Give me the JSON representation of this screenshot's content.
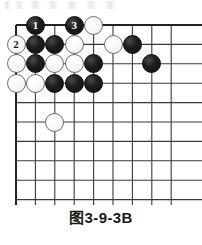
{
  "figure": {
    "caption": "图3-9-3B",
    "type": "go-board-diagram"
  },
  "board": {
    "columns": 9,
    "rows": 10,
    "origin_x": 16,
    "origin_y": 25,
    "spacing": 19.4,
    "line_color": "#3a3a3a",
    "edge_line_color": "#222222",
    "background": "#ffffff",
    "stone_radius": 9.5
  },
  "colors": {
    "black_stone": "#1d1d1d",
    "white_stone": "#f7f7f7",
    "white_stone_outline": "#707070",
    "caption_text": "#1a1a1a"
  },
  "stones": [
    {
      "id": "s0",
      "color": "black",
      "col": 1,
      "row": 0,
      "label": "1"
    },
    {
      "id": "s1",
      "color": "black",
      "col": 3,
      "row": 0,
      "label": "3"
    },
    {
      "id": "s2",
      "color": "white",
      "col": 4,
      "row": 0,
      "label": ""
    },
    {
      "id": "s3",
      "color": "white",
      "col": 0,
      "row": 1,
      "label": "2"
    },
    {
      "id": "s4",
      "color": "black",
      "col": 1,
      "row": 1,
      "label": ""
    },
    {
      "id": "s5",
      "color": "black",
      "col": 2,
      "row": 1,
      "label": ""
    },
    {
      "id": "s6",
      "color": "white",
      "col": 3,
      "row": 1,
      "label": ""
    },
    {
      "id": "s7",
      "color": "white",
      "col": 5,
      "row": 1,
      "label": ""
    },
    {
      "id": "s8",
      "color": "black",
      "col": 6,
      "row": 1,
      "label": ""
    },
    {
      "id": "s9",
      "color": "white",
      "col": 0,
      "row": 2,
      "label": ""
    },
    {
      "id": "s10",
      "color": "black",
      "col": 1,
      "row": 2,
      "label": ""
    },
    {
      "id": "s11",
      "color": "white",
      "col": 2,
      "row": 2,
      "label": ""
    },
    {
      "id": "s12",
      "color": "white",
      "col": 3,
      "row": 2,
      "label": ""
    },
    {
      "id": "s13",
      "color": "black",
      "col": 4,
      "row": 2,
      "label": ""
    },
    {
      "id": "s14",
      "color": "black",
      "col": 7,
      "row": 2,
      "label": ""
    },
    {
      "id": "s15",
      "color": "white",
      "col": 0,
      "row": 3,
      "label": ""
    },
    {
      "id": "s16",
      "color": "white",
      "col": 1,
      "row": 3,
      "label": ""
    },
    {
      "id": "s17",
      "color": "black",
      "col": 2,
      "row": 3,
      "label": ""
    },
    {
      "id": "s18",
      "color": "black",
      "col": 3,
      "row": 3,
      "label": ""
    },
    {
      "id": "s19",
      "color": "black",
      "col": 4,
      "row": 3,
      "label": ""
    },
    {
      "id": "s20",
      "color": "white",
      "col": 2,
      "row": 5,
      "label": ""
    }
  ],
  "move_markers": [
    {
      "number": "1",
      "color": "black",
      "col": 1,
      "row": 0
    },
    {
      "number": "2",
      "color": "white",
      "col": 0,
      "row": 1
    },
    {
      "number": "3",
      "color": "black",
      "col": 3,
      "row": 0
    }
  ]
}
